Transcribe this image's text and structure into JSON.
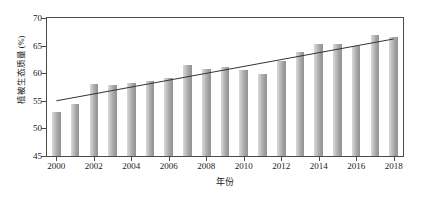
{
  "chart_data": {
    "type": "bar",
    "title": "",
    "xlabel": "年份",
    "ylabel": "植被生态质量 (%)",
    "categories": [
      "2000",
      "2001",
      "2002",
      "2003",
      "2004",
      "2005",
      "2006",
      "2007",
      "2008",
      "2009",
      "2010",
      "2011",
      "2012",
      "2013",
      "2014",
      "2015",
      "2016",
      "2017",
      "2018"
    ],
    "values": [
      52.9,
      54.5,
      58.0,
      57.8,
      58.3,
      58.6,
      59.1,
      61.5,
      60.7,
      61.1,
      60.6,
      59.8,
      62.3,
      63.9,
      65.3,
      65.3,
      65.0,
      66.9,
      66.6
    ],
    "ylim": [
      45,
      70
    ],
    "xlim": [
      1999.5,
      2018.5
    ],
    "yticks": [
      45,
      50,
      55,
      60,
      65,
      70
    ],
    "ytick_labels": [
      "45",
      "50",
      "55",
      "60",
      "65",
      "70"
    ],
    "xticks": [
      2000,
      2002,
      2004,
      2006,
      2008,
      2010,
      2012,
      2014,
      2016,
      2018
    ],
    "xtick_labels": [
      "2000",
      "2002",
      "2004",
      "2006",
      "2008",
      "2010",
      "2012",
      "2014",
      "2016",
      "2018"
    ],
    "grid": false,
    "legend": null,
    "series": [
      {
        "name": "植被生态质量",
        "type": "bar",
        "values": [
          52.9,
          54.5,
          58.0,
          57.8,
          58.3,
          58.6,
          59.1,
          61.5,
          60.7,
          61.1,
          60.6,
          59.8,
          62.3,
          63.9,
          65.3,
          65.3,
          65.0,
          66.9,
          66.6
        ],
        "color": "#a8a8a8"
      },
      {
        "name": "趋势线",
        "type": "line",
        "x_start": 2000,
        "x_end": 2018,
        "y_start": 55.0,
        "y_end": 66.2,
        "color": "#333333"
      }
    ],
    "colors": {
      "bar_light": "#d9d9d9",
      "bar_dark": "#949494",
      "axis": "#4a4a4a",
      "trend": "#333333",
      "text": "#1a1a1a",
      "background": "#ffffff"
    }
  }
}
